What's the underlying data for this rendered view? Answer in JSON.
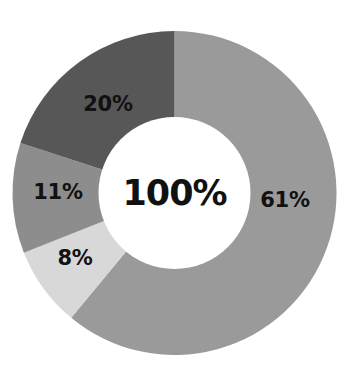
{
  "chart_data": {
    "type": "pie",
    "variant": "donut",
    "title": "",
    "subtitle": "",
    "xlabel": "",
    "ylabel": "",
    "legend": "none",
    "grid": false,
    "center_label": "100%",
    "total": 100,
    "unit": "%",
    "start_angle_deg": 0,
    "direction": "clockwise",
    "categories": [
      "61%",
      "8%",
      "11%",
      "20%"
    ],
    "values": [
      61,
      8,
      11,
      20
    ],
    "labels": [
      "61%",
      "8%",
      "11%",
      "20%"
    ],
    "colors": [
      "#9a9a9a",
      "#d8d8d8",
      "#8d8d8d",
      "#575757"
    ],
    "slices": [
      {
        "label": "61%",
        "value": 61,
        "color": "#9a9a9a",
        "start_deg": 0,
        "end_deg": 219.6,
        "label_x": 285,
        "label_y": 200
      },
      {
        "label": "8%",
        "value": 8,
        "color": "#d8d8d8",
        "start_deg": 219.6,
        "end_deg": 248.4,
        "label_x": 75,
        "label_y": 258
      },
      {
        "label": "11%",
        "value": 11,
        "color": "#8d8d8d",
        "start_deg": 248.4,
        "end_deg": 288.0,
        "label_x": 58,
        "label_y": 192
      },
      {
        "label": "20%",
        "value": 20,
        "color": "#575757",
        "start_deg": 288.0,
        "end_deg": 360.0,
        "label_x": 108,
        "label_y": 104
      }
    ],
    "geometry": {
      "center_x": 174.5,
      "center_y": 193,
      "outer_radius": 162,
      "inner_radius": 76,
      "background": "#ffffff",
      "hole_color": "#ffffff"
    }
  }
}
